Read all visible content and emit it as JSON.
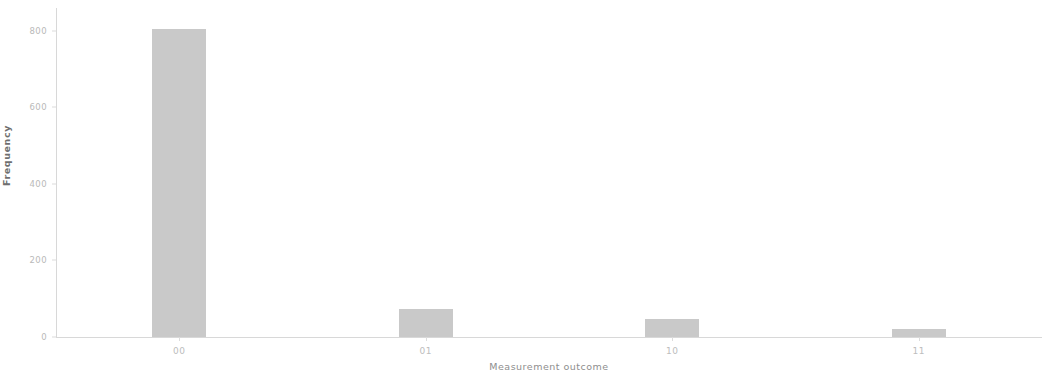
{
  "chart_data": {
    "type": "bar",
    "title": "",
    "subtitle": "",
    "categories": [
      "00",
      "01",
      "10",
      "11"
    ],
    "values": [
      806,
      74,
      48,
      20
    ],
    "series": [
      {
        "name": "Frequency",
        "values": [
          806,
          74,
          48,
          20
        ]
      }
    ],
    "xlabel": "Measurement outcome",
    "ylabel": "Frequency",
    "ylim": [
      0,
      860
    ],
    "xlim": [
      0,
      4
    ],
    "yticks": [
      0,
      200,
      400,
      600,
      800
    ],
    "ytick_labels": [
      "0",
      "200",
      "400",
      "600",
      "800"
    ],
    "xtick_labels": [
      "00",
      "01",
      "10",
      "11"
    ],
    "grid": false,
    "legend": null,
    "legend_position": "none",
    "bar_color": "#bfbfbf",
    "axis_color": "#d8d8d8",
    "tick_label_color": "#bdbdbd",
    "bar_width_fraction": 0.22
  }
}
